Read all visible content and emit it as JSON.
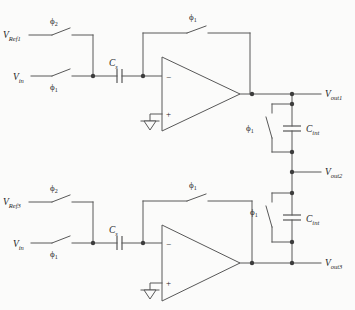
{
  "page": {
    "background": "#fbfbfa",
    "wire_color": "#585858",
    "text_color": "#1e1e1e"
  },
  "integrator1": {
    "ref_label": {
      "base": "V",
      "sub": "Ref1"
    },
    "ref_phase": {
      "base": "ϕ",
      "sub": "2"
    },
    "in_label": {
      "base": "V",
      "sub": "in"
    },
    "in_phase": {
      "base": "ϕ",
      "sub": "1"
    },
    "sampling_cap": {
      "base": "C",
      "sub": "s"
    },
    "fb_phase": {
      "base": "ϕ",
      "sub": "1"
    },
    "opamp": {
      "minus": "−",
      "plus": "+"
    }
  },
  "integrator2": {
    "ref_label": {
      "base": "V",
      "sub": "Ref3"
    },
    "ref_phase": {
      "base": "ϕ",
      "sub": "2"
    },
    "in_label": {
      "base": "V",
      "sub": "in"
    },
    "in_phase": {
      "base": "ϕ",
      "sub": "1"
    },
    "sampling_cap": {
      "base": "C",
      "sub": "s"
    },
    "fb_phase": {
      "base": "ϕ",
      "sub": "1"
    },
    "opamp": {
      "minus": "−",
      "plus": "+"
    }
  },
  "chain": {
    "out1": {
      "base": "V",
      "sub": "out1"
    },
    "stage1": {
      "phase": {
        "base": "ϕ",
        "sub": "1"
      },
      "cap": {
        "base": "C",
        "sub": "int"
      }
    },
    "out2": {
      "base": "V",
      "sub": "out2"
    },
    "stage2": {
      "phase": {
        "base": "ϕ",
        "sub": "1"
      },
      "cap": {
        "base": "C",
        "sub": "int"
      }
    },
    "out3": {
      "base": "V",
      "sub": "out3"
    }
  }
}
